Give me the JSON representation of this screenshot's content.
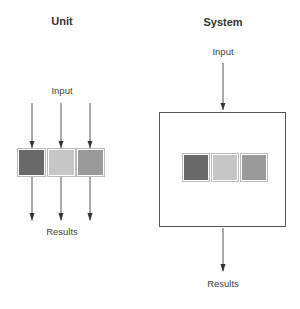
{
  "unit": {
    "title": "Unit",
    "input_label": "Input",
    "results_label": "Results",
    "blocks": [
      {
        "name": "dark",
        "color": "#6a6a6a"
      },
      {
        "name": "light",
        "color": "#c6c6c6"
      },
      {
        "name": "medium",
        "color": "#9a9a9a"
      }
    ]
  },
  "system": {
    "title": "System",
    "input_label": "Input",
    "results_label": "Results",
    "blocks": [
      {
        "name": "dark",
        "color": "#6a6a6a"
      },
      {
        "name": "light",
        "color": "#c6c6c6"
      },
      {
        "name": "medium",
        "color": "#9a9a9a"
      }
    ]
  },
  "colors": {
    "line": "#444444",
    "box_border": "#555555"
  }
}
